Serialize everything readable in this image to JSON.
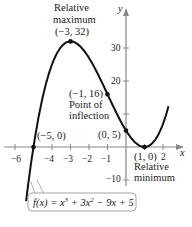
{
  "chart_data": {
    "type": "line",
    "title": "",
    "function": "f(x) = x^3 + 3x^2 - 9x + 5",
    "formula_label": {
      "prefix": "f(x) = x",
      "p1": "3",
      "mid": " + 3x",
      "p2": "2",
      "suffix": " − 9x + 5"
    },
    "xlabel": "x",
    "ylabel": "y",
    "xlim": [
      -6.5,
      2.8
    ],
    "ylim": [
      -14,
      40
    ],
    "x_ticks": [
      -6,
      -5,
      -4,
      -3,
      -2,
      -1,
      1,
      2
    ],
    "x_tick_labels": [
      "−6",
      "−4",
      "−3",
      "−2",
      "−1",
      "2"
    ],
    "y_ticks": [
      -10,
      10,
      20,
      30
    ],
    "y_tick_labels": [
      "−10",
      "20",
      "30"
    ],
    "grid": false,
    "points": [
      {
        "x": -3,
        "y": 32,
        "label": "(−3, 32)",
        "note": [
          "Relative",
          "maximum"
        ]
      },
      {
        "x": -1,
        "y": 16,
        "label": "(−1, 16)",
        "note": [
          "Point of",
          "inflection"
        ]
      },
      {
        "x": 0,
        "y": 5,
        "label": "(0, 5)",
        "note": []
      },
      {
        "x": 1,
        "y": 0,
        "label": "(1, 0)",
        "note": [
          "Relative",
          "minimum"
        ]
      },
      {
        "x": -5,
        "y": 0,
        "label": "(−5, 0)",
        "note": []
      }
    ]
  }
}
